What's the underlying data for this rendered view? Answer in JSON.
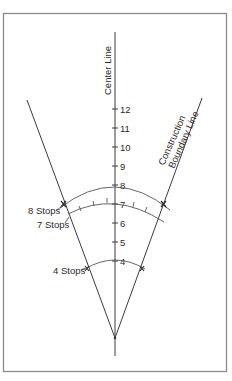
{
  "diagram": {
    "center_line_label": "Center Line",
    "boundary_line_label_1": "Construction",
    "boundary_line_label_2": "Boundary Line",
    "scale_ticks": [
      "12",
      "11",
      "10",
      "9",
      "8",
      "7",
      "6",
      "5",
      "4"
    ],
    "arcs": [
      {
        "label": "8 Stops",
        "value": "8"
      },
      {
        "label": "7 Stops",
        "value": "7"
      },
      {
        "label": "4 Stops",
        "value": "4"
      }
    ],
    "colors": {
      "line": "#3a3a3a",
      "arc": "#555555",
      "frame": "#8a8a8a",
      "text": "#2a2a2a"
    }
  }
}
